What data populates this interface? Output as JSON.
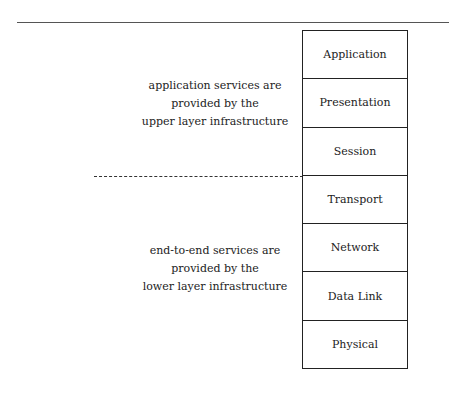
{
  "diagram": {
    "type": "osi-layer-stack",
    "layers": [
      {
        "label": "Application"
      },
      {
        "label": "Presentation"
      },
      {
        "label": "Session"
      },
      {
        "label": "Transport"
      },
      {
        "label": "Network"
      },
      {
        "label": "Data Link"
      },
      {
        "label": "Physical"
      }
    ],
    "divider": {
      "style": "dashed",
      "between": [
        "Session",
        "Transport"
      ]
    },
    "annotations": {
      "upper": {
        "lines": [
          "application services are",
          "provided by the",
          "upper layer infrastructure"
        ]
      },
      "lower": {
        "lines": [
          "end-to-end services are",
          "provided by the",
          "lower layer infrastructure"
        ]
      }
    }
  }
}
